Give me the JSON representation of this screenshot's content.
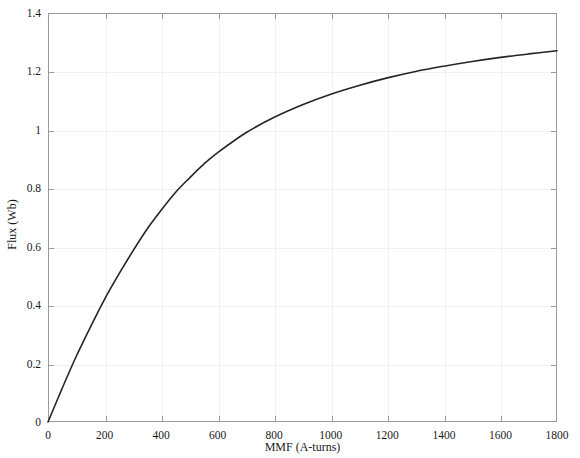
{
  "chart_data": {
    "type": "line",
    "title": "",
    "xlabel": "MMF (A-turns)",
    "ylabel": "Flux (Wb)",
    "xlim": [
      0,
      1800
    ],
    "ylim": [
      0,
      1.4
    ],
    "grid": true,
    "legend": null,
    "xticks": [
      0,
      200,
      400,
      600,
      800,
      1000,
      1200,
      1400,
      1600,
      1800
    ],
    "xtick_labels": [
      "0",
      "200",
      "400",
      "600",
      "800",
      "1000",
      "1200",
      "1400",
      "1600",
      "1800"
    ],
    "yticks": [
      0,
      0.2,
      0.4,
      0.6,
      0.8,
      1.0,
      1.2,
      1.4
    ],
    "ytick_labels": [
      "0",
      "0.2",
      "0.4",
      "0.6",
      "0.8",
      "1",
      "1.2",
      "1.4"
    ],
    "line_color": "#252525",
    "line_width": 1.6,
    "series": [
      {
        "name": "Magnetization curve",
        "x": [
          0,
          50,
          100,
          150,
          200,
          250,
          300,
          350,
          400,
          450,
          500,
          550,
          600,
          700,
          800,
          900,
          1000,
          1100,
          1200,
          1300,
          1400,
          1500,
          1600,
          1700,
          1800
        ],
        "y": [
          0.0,
          0.115,
          0.225,
          0.325,
          0.42,
          0.505,
          0.585,
          0.66,
          0.725,
          0.785,
          0.835,
          0.882,
          0.922,
          0.99,
          1.043,
          1.086,
          1.122,
          1.152,
          1.178,
          1.2,
          1.218,
          1.234,
          1.248,
          1.26,
          1.271
        ]
      }
    ]
  },
  "annotations": {
    "top_artifact_text": ""
  }
}
